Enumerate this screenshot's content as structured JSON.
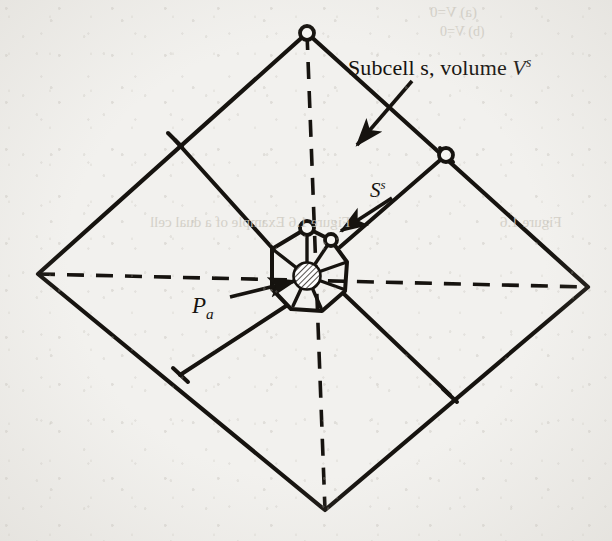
{
  "figure": {
    "kind": "geometry-diagram",
    "background_color": "#f2f1ee",
    "ink_color": "#16130f"
  },
  "labels": {
    "subcell": {
      "text_prefix": "Subcell s, volume ",
      "symbol": "V",
      "superscript": "s"
    },
    "surface": {
      "symbol": "S",
      "superscript": "s"
    },
    "point": {
      "symbol": "P",
      "subscript": "a"
    }
  },
  "bleed_through": {
    "top_line1": "(a) V=0",
    "top_line2": "(b) V=0",
    "caption": "Figure 1.6   Example of a dual cell",
    "right": "Figure 1.6"
  },
  "geometry": {
    "outer_quad": [
      [
        307,
        33
      ],
      [
        588,
        287
      ],
      [
        325,
        510
      ],
      [
        38,
        274
      ]
    ],
    "center": [
      307,
      276
    ],
    "dashed_diagonals": [
      [
        [
          307,
          33
        ],
        [
          325,
          510
        ]
      ],
      [
        [
          38,
          274
        ],
        [
          588,
          287
        ]
      ]
    ],
    "edge_midpoints": [
      [
        175,
        140
      ],
      [
        446,
        155
      ],
      [
        450,
        395
      ],
      [
        180,
        375
      ]
    ],
    "dual_polygon": [
      [
        307,
        228
      ],
      [
        331,
        240
      ],
      [
        347,
        262
      ],
      [
        345,
        291
      ],
      [
        322,
        311
      ],
      [
        291,
        309
      ],
      [
        272,
        289
      ],
      [
        272,
        249
      ]
    ],
    "open_circles": [
      {
        "cx": 307,
        "cy": 33,
        "r": 7
      },
      {
        "cx": 446,
        "cy": 155,
        "r": 7
      },
      {
        "cx": 307,
        "cy": 228,
        "r": 7
      },
      {
        "cx": 331,
        "cy": 240,
        "r": 6
      }
    ],
    "node": {
      "cx": 307,
      "cy": 276,
      "r": 13,
      "fill": "hatched"
    },
    "arrows": [
      {
        "name": "subcell-arrow",
        "from": [
          410,
          83
        ],
        "to": [
          358,
          143
        ]
      },
      {
        "name": "surface-arrow",
        "from": [
          390,
          199
        ],
        "to": [
          340,
          230
        ]
      },
      {
        "name": "point-arrow",
        "from": [
          232,
          296
        ],
        "to": [
          296,
          280
        ]
      }
    ]
  }
}
